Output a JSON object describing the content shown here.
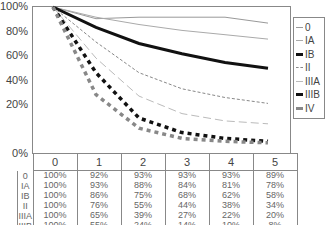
{
  "chart_data": {
    "type": "line",
    "title": "",
    "xlabel": "",
    "ylabel": "",
    "x": [
      0,
      1,
      2,
      3,
      4,
      5
    ],
    "y_ticks": [
      "100%",
      "80%",
      "60%",
      "40%",
      "20%",
      "0%"
    ],
    "ylim": [
      0,
      100
    ],
    "grid": false,
    "legend_position": "right",
    "series": [
      {
        "name": "0",
        "values": [
          100,
          92,
          93,
          93,
          93,
          89
        ]
      },
      {
        "name": "IA",
        "values": [
          100,
          93,
          88,
          84,
          81,
          78
        ]
      },
      {
        "name": "IB",
        "values": [
          100,
          86,
          75,
          68,
          62,
          58
        ]
      },
      {
        "name": "II",
        "values": [
          100,
          76,
          55,
          44,
          38,
          34
        ]
      },
      {
        "name": "IIIA",
        "values": [
          100,
          65,
          39,
          27,
          22,
          20
        ]
      },
      {
        "name": "IIIB",
        "values": [
          100,
          55,
          24,
          14,
          10,
          8
        ]
      },
      {
        "name": "IV",
        "values": [
          100,
          40,
          17,
          10,
          8,
          7
        ]
      }
    ]
  },
  "axis": {
    "y_labels": [
      "100%",
      "80%",
      "60%",
      "40%",
      "20%",
      "0%"
    ]
  },
  "legend": {
    "items": [
      "0",
      "IA",
      "IB",
      "II",
      "IIIA",
      "IIIB",
      "IV"
    ]
  },
  "table": {
    "header": [
      "0",
      "1",
      "2",
      "3",
      "4",
      "5"
    ],
    "rows": [
      {
        "label": "0",
        "cells": [
          "100%",
          "92%",
          "93%",
          "93%",
          "93%",
          "89%"
        ]
      },
      {
        "label": "IA",
        "cells": [
          "100%",
          "93%",
          "88%",
          "84%",
          "81%",
          "78%"
        ]
      },
      {
        "label": "IB",
        "cells": [
          "100%",
          "86%",
          "75%",
          "68%",
          "62%",
          "58%"
        ]
      },
      {
        "label": "II",
        "cells": [
          "100%",
          "76%",
          "55%",
          "44%",
          "38%",
          "34%"
        ]
      },
      {
        "label": "IIIA",
        "cells": [
          "100%",
          "65%",
          "39%",
          "27%",
          "22%",
          "20%"
        ]
      },
      {
        "label": "IIIB",
        "cells": [
          "100%",
          "55%",
          "24%",
          "14%",
          "10%",
          "8%"
        ]
      },
      {
        "label": "IV",
        "cells": [
          "100%",
          "40%",
          "17%",
          "10%",
          "8%",
          "7%"
        ]
      }
    ]
  }
}
